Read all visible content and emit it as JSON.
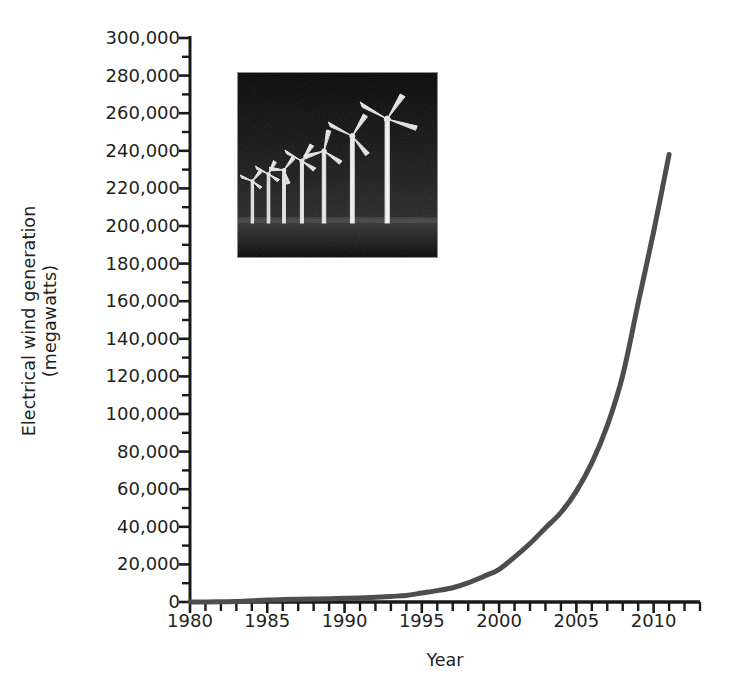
{
  "chart_data": {
    "type": "line",
    "title": "",
    "xlabel": "Year",
    "ylabel": "Electrical wind generation\n(megawatts)",
    "ylabel_line1": "Electrical wind generation",
    "ylabel_line2": "(megawatts)",
    "xlim": [
      1980,
      2013
    ],
    "ylim": [
      0,
      300000
    ],
    "x_major_tick_labels": [
      "1980",
      "1985",
      "1990",
      "1995",
      "2000",
      "2005",
      "2010"
    ],
    "x_major_tick_values": [
      1980,
      1985,
      1990,
      1995,
      2000,
      2005,
      2010
    ],
    "x_minor_tick_interval": 1,
    "y_tick_labels": [
      "0",
      "20,000",
      "40,000",
      "60,000",
      "80,000",
      "100,000",
      "120,000",
      "140,000",
      "160,000",
      "180,000",
      "200,000",
      "220,000",
      "240,000",
      "260,000",
      "280,000",
      "300,000"
    ],
    "y_tick_values": [
      0,
      20000,
      40000,
      60000,
      80000,
      100000,
      120000,
      140000,
      160000,
      180000,
      200000,
      220000,
      240000,
      260000,
      280000,
      300000
    ],
    "y_minor_tick_interval": 10000,
    "grid": false,
    "legend": null,
    "line_color": "#4d4d4d",
    "axis_color": "#1a1a1a",
    "line_width_px": 5,
    "x": [
      1980,
      1981,
      1982,
      1983,
      1984,
      1985,
      1986,
      1987,
      1988,
      1989,
      1990,
      1991,
      1992,
      1993,
      1994,
      1995,
      1996,
      1997,
      1998,
      1999,
      2000,
      2001,
      2002,
      2003,
      2004,
      2005,
      2006,
      2007,
      2008,
      2009,
      2010,
      2011
    ],
    "series": [
      {
        "name": "Electrical wind generation",
        "values": [
          10,
          25,
          90,
          210,
          600,
          1020,
          1270,
          1450,
          1580,
          1730,
          1930,
          2170,
          2510,
          2990,
          3490,
          4780,
          6070,
          7600,
          10200,
          13600,
          17400,
          23900,
          31100,
          39400,
          47600,
          59000,
          74000,
          93800,
          120600,
          159000,
          197000,
          238000
        ]
      }
    ],
    "inset_image": {
      "name": "wind-turbine-farm-photo",
      "description": "Black-and-white photograph of seven wind turbines in a row increasing in size from left to right against a dark sky",
      "turbine_count": 7
    }
  },
  "axes": {
    "x_axis_name": "year-axis",
    "y_axis_name": "wind-generation-axis"
  }
}
